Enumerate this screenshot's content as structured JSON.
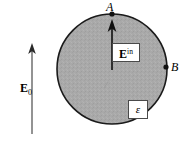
{
  "figure": {
    "caption_text": "",
    "background_color": "#ffffff"
  },
  "sphere": {
    "name": "dielectric-sphere",
    "fill_color": "#a9a9a9",
    "stroke_color": "#1a1a1a",
    "center_x": 112,
    "center_y": 69,
    "radius": 55
  },
  "external_field": {
    "label_main": "E",
    "label_sub": "0",
    "arrow_color": "#6f6f6f",
    "arrow_tail_x": 32,
    "arrow_tail_y": 134,
    "arrow_tip_x": 32,
    "arrow_tip_y": 44
  },
  "internal_field": {
    "label_main": "E",
    "label_sup": "in",
    "arrow_color": "#111111",
    "arrow_tail_x": 112,
    "arrow_tail_y": 70,
    "arrow_tip_x": 112,
    "arrow_tip_y": 20
  },
  "permittivity": {
    "symbol": "ε"
  },
  "points": [
    {
      "label": "A",
      "x": 112,
      "y": 14,
      "marker": "filled-dot"
    },
    {
      "label": "B",
      "x": 166,
      "y": 67,
      "marker": "filled-dot"
    }
  ]
}
